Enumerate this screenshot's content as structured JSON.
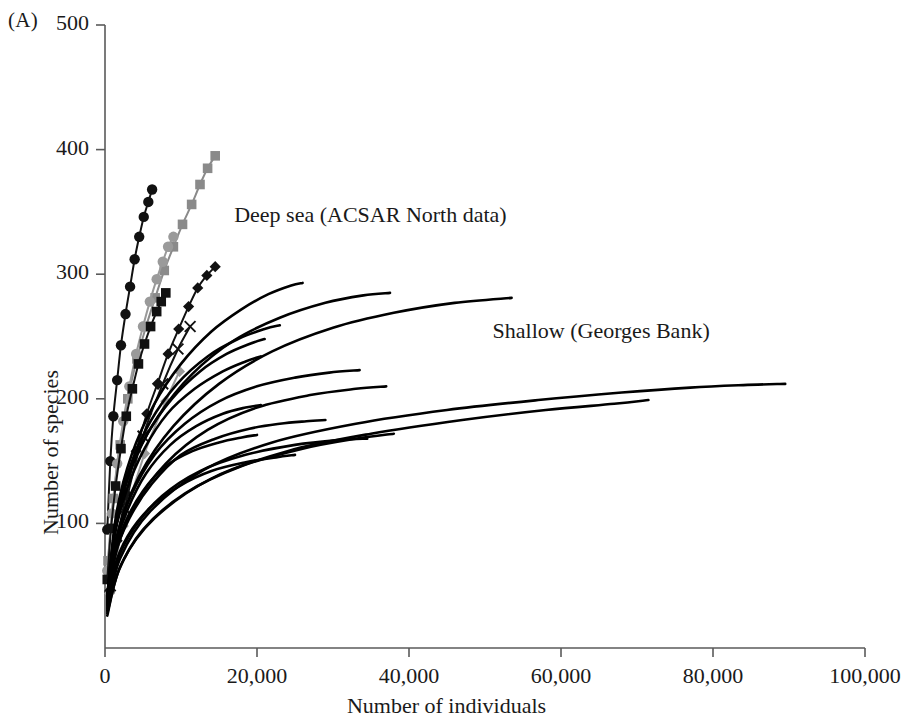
{
  "panel": {
    "label": "(A)"
  },
  "chart_data": {
    "type": "line",
    "title": "",
    "xlabel": "Number of individuals",
    "ylabel": "Number of species",
    "xlim": [
      0,
      100000
    ],
    "ylim": [
      0,
      500
    ],
    "xticks": [
      0,
      20000,
      40000,
      60000,
      80000,
      100000
    ],
    "xtick_labels": [
      "0",
      "20,000",
      "40,000",
      "60,000",
      "80,000",
      "100,000"
    ],
    "yticks": [
      100,
      200,
      300,
      400,
      500
    ],
    "ytick_labels": [
      "100",
      "200",
      "300",
      "400",
      "500"
    ],
    "grid": false,
    "legend": "none",
    "annotations": [
      {
        "text": "Deep sea (ACSAR North data)",
        "x": 17000,
        "y": 345
      },
      {
        "text": "Shallow (Georges Bank)",
        "x": 51000,
        "y": 252
      }
    ],
    "groups": [
      {
        "name": "Deep sea (ACSAR North data)",
        "description": "Steeply rising species accumulation curves with plotting symbols",
        "color": "#000000",
        "series": [
          {
            "name": "deep-black-circles",
            "marker": "filled-circle",
            "color": "#111111",
            "x": [
              300,
              700,
              1100,
              1600,
              2100,
              2700,
              3300,
              3900,
              4500,
              5100,
              5700,
              6200
            ],
            "y": [
              95,
              150,
              186,
              215,
              243,
              268,
              290,
              312,
              330,
              346,
              358,
              368
            ]
          },
          {
            "name": "deep-gray-squares",
            "marker": "filled-square",
            "color": "#8a8a8a",
            "x": [
              400,
              1100,
              2000,
              3000,
              4200,
              5400,
              6600,
              7800,
              9000,
              10200,
              11400,
              12500,
              13500,
              14500
            ],
            "y": [
              70,
              120,
              163,
              200,
              232,
              258,
              281,
              303,
              322,
              340,
              356,
              372,
              385,
              395
            ]
          },
          {
            "name": "deep-gray-circles",
            "marker": "filled-circle",
            "color": "#9a9a9a",
            "x": [
              300,
              900,
              1600,
              2400,
              3200,
              4100,
              5000,
              5900,
              6800,
              7600,
              8300,
              9000
            ],
            "y": [
              62,
              108,
              148,
              182,
              210,
              236,
              258,
              278,
              296,
              310,
              322,
              330
            ]
          },
          {
            "name": "deep-black-squares",
            "marker": "filled-square",
            "color": "#111111",
            "x": [
              300,
              800,
              1400,
              2100,
              2800,
              3600,
              4400,
              5200,
              6000,
              6800,
              7400,
              8000
            ],
            "y": [
              55,
              96,
              130,
              160,
              186,
              208,
              228,
              244,
              258,
              270,
              278,
              285
            ]
          },
          {
            "name": "deep-black-diamonds",
            "marker": "filled-diamond",
            "color": "#111111",
            "x": [
              600,
              1600,
              2800,
              4100,
              5500,
              6900,
              8300,
              9700,
              11000,
              12200,
              13400,
              14500
            ],
            "y": [
              45,
              86,
              124,
              158,
              188,
              212,
              236,
              256,
              274,
              289,
              299,
              306
            ]
          },
          {
            "name": "deep-crosses",
            "marker": "cross",
            "color": "#111111",
            "x": [
              700,
              2600,
              5000,
              7600,
              9600,
              11200
            ],
            "y": [
              50,
              112,
              170,
              212,
              240,
              258
            ]
          },
          {
            "name": "deep-gray-diamond-short",
            "marker": "filled-diamond",
            "color": "#9a9a9a",
            "x": [
              600,
              2400,
              5200,
              8000,
              9800
            ],
            "y": [
              44,
              98,
              156,
              198,
              222
            ]
          }
        ]
      },
      {
        "name": "Shallow (Georges Bank)",
        "description": "Plain black species accumulation curves rising to large sample sizes",
        "color": "#000000",
        "series": [
          {
            "name": "shallow-curve-1",
            "marker": "none",
            "x": [
              300,
              1500,
              3500,
              6500,
              10000,
              14000,
              18000,
              21500,
              24500,
              26000
            ],
            "y": [
              42,
              108,
              155,
              196,
              228,
              254,
              272,
              284,
              291,
              293
            ]
          },
          {
            "name": "shallow-curve-2",
            "marker": "none",
            "x": [
              300,
              1500,
              3500,
              7000,
              11500,
              17000,
              23000,
              29000,
              34000,
              37500
            ],
            "y": [
              40,
              100,
              146,
              186,
              220,
              247,
              265,
              277,
              283,
              285
            ]
          },
          {
            "name": "shallow-curve-3",
            "marker": "none",
            "x": [
              300,
              1800,
              4500,
              9000,
              15000,
              22000,
              30000,
              38000,
              46000,
              53500
            ],
            "y": [
              40,
              95,
              138,
              178,
              212,
              238,
              257,
              269,
              277,
              281
            ]
          },
          {
            "name": "shallow-curve-4",
            "marker": "none",
            "x": [
              300,
              1400,
              3200,
              6000,
              9500,
              13500,
              17500,
              21000,
              23000
            ],
            "y": [
              42,
              100,
              144,
              182,
              212,
              234,
              248,
              256,
              259
            ]
          },
          {
            "name": "shallow-curve-5",
            "marker": "none",
            "x": [
              300,
              1300,
              3000,
              5600,
              8800,
              12500,
              16000,
              19000,
              21000
            ],
            "y": [
              40,
              94,
              136,
              172,
              200,
              222,
              236,
              244,
              248
            ]
          },
          {
            "name": "shallow-curve-6",
            "marker": "none",
            "x": [
              300,
              1200,
              2800,
              5200,
              8200,
              11800,
              15500,
              18500,
              20500
            ],
            "y": [
              38,
              88,
              126,
              160,
              188,
              208,
              222,
              230,
              234
            ]
          },
          {
            "name": "shallow-curve-7",
            "marker": "none",
            "x": [
              300,
              1400,
              3400,
              6500,
              10500,
              15000,
              20000,
              25000,
              29500,
              33500
            ],
            "y": [
              38,
              86,
              122,
              155,
              180,
              198,
              210,
              217,
              221,
              223
            ]
          },
          {
            "name": "shallow-curve-8",
            "marker": "none",
            "x": [
              300,
              1600,
              4000,
              8000,
              13500,
              20000,
              27000,
              33000,
              37000
            ],
            "y": [
              36,
              80,
              115,
              148,
              175,
              193,
              203,
              208,
              210
            ]
          },
          {
            "name": "shallow-curve-9",
            "marker": "none",
            "x": [
              300,
              1200,
              2900,
              5400,
              8600,
              12000,
              15500,
              18500,
              20500
            ],
            "y": [
              36,
              78,
              110,
              140,
              163,
              178,
              188,
              193,
              195
            ]
          },
          {
            "name": "shallow-curve-10",
            "marker": "none",
            "x": [
              300,
              1300,
              3200,
              6200,
              10000,
              14500,
              19000,
              23000,
              26500,
              29000
            ],
            "y": [
              34,
              74,
              104,
              132,
              155,
              168,
              176,
              180,
              182,
              183
            ]
          },
          {
            "name": "shallow-curve-11",
            "marker": "none",
            "x": [
              300,
              1100,
              2600,
              5000,
              8000,
              11500,
              15000,
              18000,
              20000
            ],
            "y": [
              34,
              72,
              100,
              126,
              146,
              158,
              165,
              169,
              171
            ]
          },
          {
            "name": "shallow-curve-12",
            "marker": "none",
            "x": [
              300,
              1500,
              3800,
              7500,
              12500,
              18500,
              25000,
              31000,
              34500
            ],
            "y": [
              32,
              68,
              96,
              122,
              142,
              155,
              163,
              167,
              168
            ]
          },
          {
            "name": "shallow-curve-13",
            "marker": "none",
            "x": [
              300,
              1200,
              3000,
              6000,
              9800,
              14000,
              18500,
              22500,
              25000
            ],
            "y": [
              30,
              64,
              90,
              113,
              130,
              142,
              149,
              153,
              155
            ]
          },
          {
            "name": "shallow-curve-14",
            "marker": "none",
            "x": [
              300,
              2000,
              6000,
              13000,
              22000,
              33000,
              45000,
              57000,
              68000,
              77000,
              84000,
              89500
            ],
            "y": [
              30,
              72,
              110,
              143,
              165,
              180,
              191,
              199,
              205,
              209,
              211,
              212
            ]
          },
          {
            "name": "shallow-curve-15",
            "marker": "none",
            "x": [
              300,
              2200,
              6500,
              14000,
              24000,
              35000,
              47000,
              58000,
              67000,
              71500
            ],
            "y": [
              28,
              68,
              104,
              136,
              158,
              172,
              183,
              191,
              196,
              199
            ]
          },
          {
            "name": "shallow-curve-16",
            "marker": "none",
            "x": [
              300,
              1800,
              5000,
              10500,
              18000,
              26000,
              33000,
              38000
            ],
            "y": [
              26,
              62,
              95,
              124,
              146,
              160,
              168,
              172
            ]
          }
        ]
      }
    ]
  }
}
